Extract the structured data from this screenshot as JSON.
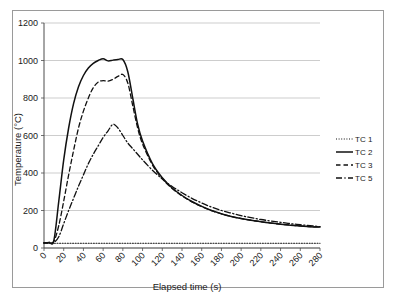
{
  "chart_data": {
    "type": "line",
    "title": "",
    "xlabel": "Elapsed time (s)",
    "ylabel": "Temperature (°C)",
    "xlim": [
      0,
      280
    ],
    "ylim": [
      0,
      1200
    ],
    "xticks": [
      0,
      20,
      40,
      60,
      80,
      100,
      120,
      140,
      160,
      180,
      200,
      220,
      240,
      260,
      280
    ],
    "yticks": [
      0,
      200,
      400,
      600,
      800,
      1000,
      1200
    ],
    "grid": "horizontal",
    "legend_position": "right",
    "x": [
      0,
      5,
      10,
      15,
      20,
      25,
      30,
      35,
      40,
      45,
      50,
      55,
      60,
      65,
      70,
      75,
      80,
      85,
      90,
      95,
      100,
      110,
      120,
      130,
      140,
      150,
      160,
      170,
      180,
      190,
      200,
      210,
      220,
      230,
      240,
      250,
      260,
      270,
      280
    ],
    "series": [
      {
        "name": "TC 1",
        "style": "dotted",
        "values": [
          25,
          25,
          25,
          25,
          25,
          25,
          25,
          25,
          25,
          25,
          25,
          25,
          25,
          25,
          25,
          25,
          25,
          25,
          25,
          25,
          25,
          25,
          25,
          25,
          25,
          25,
          25,
          25,
          25,
          25,
          25,
          25,
          25,
          25,
          25,
          25,
          25,
          25,
          25
        ]
      },
      {
        "name": "TC 2",
        "style": "solid",
        "values": [
          28,
          30,
          40,
          250,
          470,
          640,
          770,
          860,
          920,
          960,
          985,
          1000,
          1010,
          998,
          1002,
          1005,
          1005,
          940,
          800,
          660,
          570,
          450,
          375,
          320,
          280,
          248,
          222,
          200,
          183,
          168,
          157,
          148,
          140,
          133,
          127,
          122,
          118,
          114,
          112
        ]
      },
      {
        "name": "TC 3",
        "style": "dashed",
        "values": [
          28,
          29,
          35,
          120,
          250,
          390,
          520,
          640,
          730,
          800,
          855,
          885,
          893,
          890,
          900,
          915,
          925,
          880,
          760,
          640,
          555,
          443,
          370,
          317,
          278,
          246,
          221,
          199,
          182,
          168,
          157,
          148,
          140,
          133,
          127,
          122,
          118,
          114,
          112
        ]
      },
      {
        "name": "TC 5",
        "style": "dashdot",
        "values": [
          26,
          27,
          30,
          60,
          130,
          200,
          265,
          330,
          390,
          450,
          500,
          545,
          590,
          625,
          660,
          640,
          600,
          560,
          530,
          500,
          470,
          415,
          368,
          328,
          295,
          265,
          240,
          218,
          200,
          186,
          173,
          162,
          152,
          144,
          137,
          130,
          124,
          119,
          114
        ]
      }
    ]
  },
  "axis": {
    "ylabel": "Temperature (°C)",
    "xlabel": "Elapsed time (s)",
    "ytick_labels": [
      "0",
      "200",
      "400",
      "600",
      "800",
      "1000",
      "1200"
    ],
    "xtick_labels": [
      "0",
      "20",
      "40",
      "60",
      "80",
      "100",
      "120",
      "140",
      "160",
      "180",
      "200",
      "220",
      "240",
      "260",
      "280"
    ]
  },
  "legend": {
    "items": [
      {
        "label": "TC 1",
        "style": "dotted"
      },
      {
        "label": "TC 2",
        "style": "solid"
      },
      {
        "label": "TC 3",
        "style": "dashed"
      },
      {
        "label": "TC 5",
        "style": "dashdot"
      }
    ]
  },
  "colors": {
    "series": "#111111",
    "grid": "#b8b8b8",
    "axis": "#4d4d4d",
    "frame": "#9a9a9a",
    "background": "#ffffff"
  }
}
